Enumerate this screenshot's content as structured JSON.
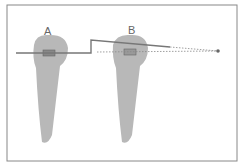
{
  "labels": {
    "a": "A",
    "b": "B"
  },
  "colors": {
    "tooth": "#b5b5b5",
    "wire": "#777777",
    "border": "#888888"
  }
}
